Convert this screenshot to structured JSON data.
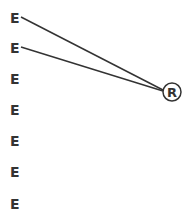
{
  "diagram": {
    "e_nodes": [
      {
        "label": "E",
        "y": 11
      },
      {
        "label": "E",
        "y": 41
      },
      {
        "label": "E",
        "y": 72
      },
      {
        "label": "E",
        "y": 103
      },
      {
        "label": "E",
        "y": 134
      },
      {
        "label": "E",
        "y": 165
      },
      {
        "label": "E",
        "y": 197
      }
    ],
    "r_node": {
      "label": "R",
      "cx": 172,
      "cy": 92,
      "r": 9
    },
    "edges": [
      {
        "from": "E0",
        "to": "R"
      },
      {
        "from": "E1",
        "to": "R"
      }
    ],
    "colors": {
      "stroke": "#333333",
      "text": "#333333",
      "background": "#ffffff"
    }
  }
}
